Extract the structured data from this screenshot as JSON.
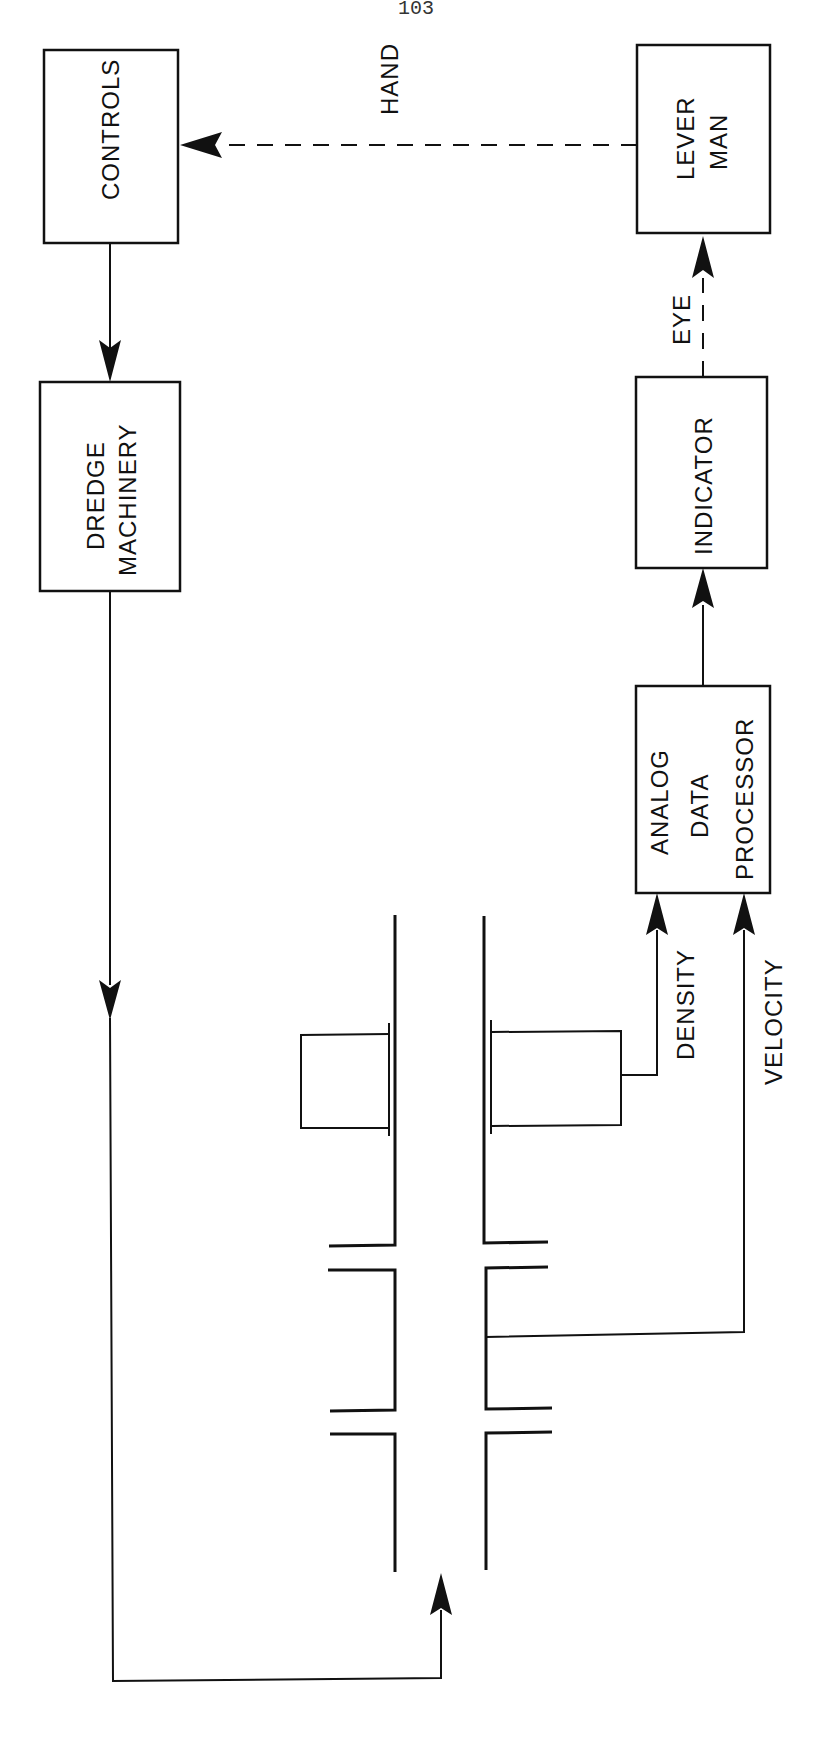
{
  "page": {
    "number": "103"
  },
  "diagram": {
    "blocks": {
      "controls": "CONTROLS",
      "dredge_machinery_line1": "DREDGE",
      "dredge_machinery_line2": "MACHINERY",
      "lever_man_line1": "LEVER",
      "lever_man_line2": "MAN",
      "indicator": "INDICATOR",
      "processor_line1": "ANALOG",
      "processor_line2": "DATA",
      "processor_line3": "PROCESSOR"
    },
    "signals": {
      "hand": "HAND",
      "eye": "EYE",
      "density": "DENSITY",
      "velocity": "VELOCITY"
    },
    "connections": [
      {
        "from": "LEVER MAN",
        "to": "CONTROLS",
        "label": "HAND",
        "style": "dashed"
      },
      {
        "from": "CONTROLS",
        "to": "DREDGE MACHINERY",
        "style": "solid"
      },
      {
        "from": "DREDGE MACHINERY",
        "to": "pipeline",
        "style": "solid"
      },
      {
        "from": "density sensor",
        "to": "ANALOG DATA PROCESSOR",
        "label": "DENSITY",
        "style": "solid"
      },
      {
        "from": "velocity tap",
        "to": "ANALOG DATA PROCESSOR",
        "label": "VELOCITY",
        "style": "solid"
      },
      {
        "from": "ANALOG DATA PROCESSOR",
        "to": "INDICATOR",
        "style": "solid"
      },
      {
        "from": "INDICATOR",
        "to": "LEVER MAN",
        "label": "EYE",
        "style": "dashed"
      }
    ]
  }
}
